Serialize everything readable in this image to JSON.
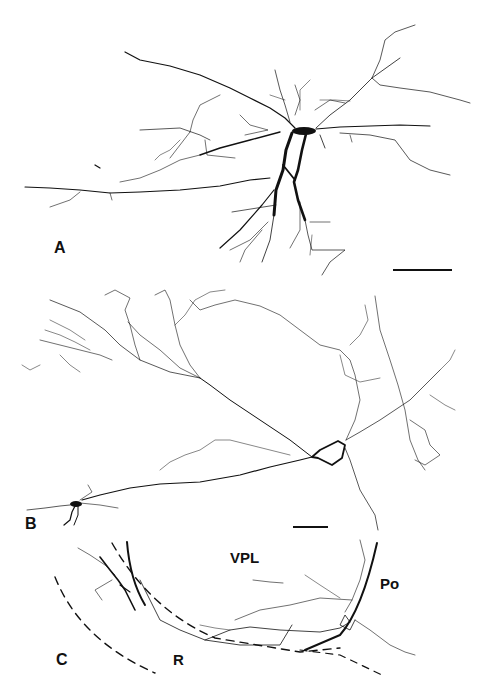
{
  "figure": {
    "panels": [
      {
        "id": "A",
        "label": "A",
        "label_pos": [
          54,
          240
        ],
        "scale_bar": {
          "x1": 393,
          "x2": 452,
          "y": 270
        }
      },
      {
        "id": "B",
        "label": "B",
        "label_pos": [
          25,
          516
        ],
        "scale_bar": {
          "x1": 293,
          "x2": 328,
          "y": 527
        }
      },
      {
        "id": "C",
        "label": "C",
        "label_pos": [
          56,
          652
        ]
      }
    ],
    "region_labels": {
      "vpl": "VPL",
      "po": "Po",
      "r": "R"
    },
    "colors": {
      "ink": "#111111",
      "background": "#ffffff"
    }
  }
}
